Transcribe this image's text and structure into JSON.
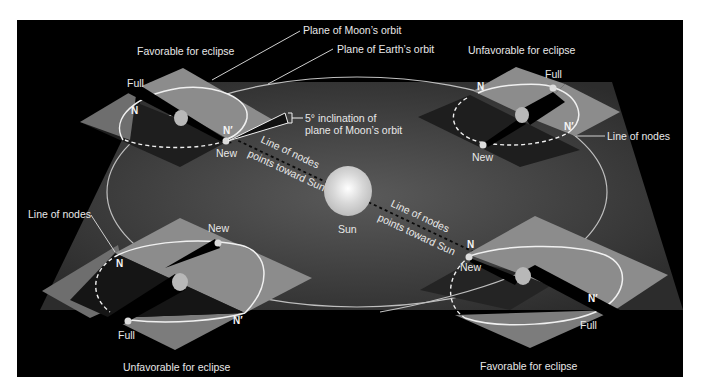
{
  "diagram": {
    "title_labels": {
      "plane_moon_orbit": "Plane of Moon’s orbit",
      "plane_earth_orbit": "Plane of Earth’s orbit",
      "inclination_line1": "5° inclination of",
      "inclination_line2": "plane of Moon’s orbit",
      "sun": "Sun",
      "line_of_nodes_sun_1a": "Line of nodes",
      "line_of_nodes_sun_1b": "points toward Sun",
      "line_of_nodes_sun_2a": "Line of nodes",
      "line_of_nodes_sun_2b": "points toward Sun"
    },
    "quadrants": {
      "top_left": {
        "caption": "Favorable for eclipse",
        "full": "Full",
        "new": "New",
        "node_n": "N",
        "node_n_prime": "N′"
      },
      "top_right": {
        "caption": "Unfavorable for eclipse",
        "full": "Full",
        "new": "New",
        "node_n": "N",
        "node_n_prime": "N′",
        "line_of_nodes": "Line of nodes"
      },
      "bottom_left": {
        "caption": "Unfavorable for eclipse",
        "full": "Full",
        "new": "New",
        "node_n": "N",
        "node_n_prime": "N′",
        "line_of_nodes": "Line of nodes"
      },
      "bottom_right": {
        "caption": "Favorable for eclipse",
        "full": "Full",
        "new": "New",
        "node_n": "N",
        "node_n_prime": "N′"
      }
    },
    "colors": {
      "background": "#000000",
      "earth_plane": "#3a3a3a",
      "moon_plane": "#8a8a8a",
      "orbit_line": "#f0f0f0",
      "sun": "#e6e6e6",
      "text": "#e8e8e8"
    }
  }
}
